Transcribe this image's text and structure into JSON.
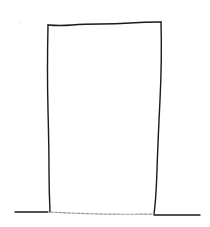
{
  "diagram": {
    "stroke_color": "#1a1a1a",
    "faint_stroke_color": "#9a9a9a",
    "background": "#ffffff",
    "shapes": {
      "rectangle": {
        "top_left": [
          48,
          25
        ],
        "top_right": [
          161,
          22
        ],
        "bottom_right": [
          154,
          214
        ],
        "bottom_left": [
          50,
          212
        ]
      },
      "ground_line": {
        "start": [
          15,
          212
        ],
        "end": [
          200,
          215
        ]
      }
    }
  }
}
